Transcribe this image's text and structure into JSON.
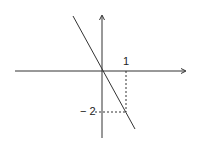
{
  "diagram": {
    "labels": {
      "x_tick": "1",
      "y_tick": "− 2"
    },
    "colors": {
      "stroke": "#333333",
      "background": "#ffffff"
    }
  }
}
